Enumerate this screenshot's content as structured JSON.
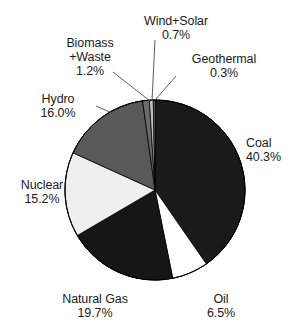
{
  "chart_data": {
    "type": "pie",
    "title": "",
    "subtitle": "",
    "xlabel": "",
    "ylabel": "",
    "legend_position": "none",
    "grid": false,
    "units": "percent",
    "start_angle_deg": 0,
    "direction": "clockwise",
    "categories": [
      "Coal",
      "Oil",
      "Natural Gas",
      "Nuclear",
      "Hydro",
      "Biomass+Waste",
      "Wind+Solar",
      "Geothermal"
    ],
    "values": [
      40.3,
      6.5,
      19.7,
      15.2,
      16.0,
      1.2,
      0.7,
      0.3
    ],
    "slices": [
      {
        "name": "Coal",
        "label_line1": "Coal",
        "label_line2": "40.3%",
        "value": 40.3,
        "value_text": "40.3%",
        "color": "#1a1a1a",
        "leader": false
      },
      {
        "name": "Oil",
        "label_line1": "Oil",
        "label_line2": "6.5%",
        "value": 6.5,
        "value_text": "6.5%",
        "color": "#ffffff",
        "leader": false
      },
      {
        "name": "Natural Gas",
        "label_line1": "Natural Gas",
        "label_line2": "19.7%",
        "value": 19.7,
        "value_text": "19.7%",
        "color": "#161616",
        "leader": false
      },
      {
        "name": "Nuclear",
        "label_line1": "Nuclear",
        "label_line2": "15.2%",
        "value": 15.2,
        "value_text": "15.2%",
        "color": "#efefef",
        "leader": false
      },
      {
        "name": "Hydro",
        "label_line1": "Hydro",
        "label_line2": "16.0%",
        "value": 16.0,
        "value_text": "16.0%",
        "color": "#595959",
        "leader": true
      },
      {
        "name": "Biomass+Waste",
        "label_line1": "Biomass",
        "label_line2": "+Waste",
        "label_line3": "1.2%",
        "value": 1.2,
        "value_text": "1.2%",
        "color": "#6b6b6b",
        "leader": true
      },
      {
        "name": "Wind+Solar",
        "label_line1": "Wind+Solar",
        "label_line2": "0.7%",
        "value": 0.7,
        "value_text": "0.7%",
        "color": "#bdbdbd",
        "leader": true
      },
      {
        "name": "Geothermal",
        "label_line1": "Geothermal",
        "label_line2": "0.3%",
        "value": 0.3,
        "value_text": "0.3%",
        "color": "#8a8a8a",
        "leader": true
      }
    ],
    "total": 99.9
  },
  "labels": {
    "wind_solar": {
      "name": "Wind+Solar",
      "pct": "0.7%"
    },
    "biomass": {
      "name_a": "Biomass",
      "name_b": "+Waste",
      "pct": "1.2%"
    },
    "geothermal": {
      "name": "Geothermal",
      "pct": "0.3%"
    },
    "hydro": {
      "name": "Hydro",
      "pct": "16.0%"
    },
    "nuclear": {
      "name": "Nuclear",
      "pct": "15.2%"
    },
    "coal": {
      "name": "Coal",
      "pct": "40.3%"
    },
    "natural_gas": {
      "name": "Natural Gas",
      "pct": "19.7%"
    },
    "oil": {
      "name": "Oil",
      "pct": "6.5%"
    }
  },
  "colors": {
    "background": "#ffffff",
    "text": "#1b1b1b",
    "outline": "#000000",
    "coal": "#1a1a1a",
    "oil": "#ffffff",
    "natural_gas": "#161616",
    "nuclear": "#efefef",
    "hydro": "#595959",
    "biomass": "#6b6b6b",
    "wind_solar": "#bdbdbd",
    "geothermal": "#8a8a8a"
  }
}
